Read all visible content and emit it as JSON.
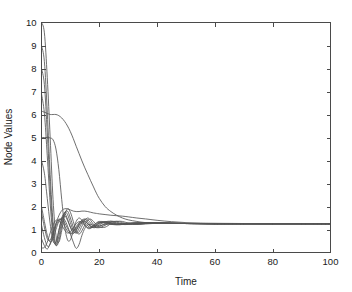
{
  "chart_data": {
    "type": "line",
    "title": "",
    "xlabel": "Time",
    "ylabel": "Node Values",
    "xlim": [
      0,
      100
    ],
    "ylim": [
      0,
      10
    ],
    "xticks": [
      0,
      20,
      40,
      60,
      80,
      100
    ],
    "yticks": [
      0,
      1,
      2,
      3,
      4,
      5,
      6,
      7,
      8,
      9,
      10
    ],
    "xtick_labels": [
      "0",
      "20",
      "40",
      "60",
      "80",
      "100"
    ],
    "ytick_labels": [
      "0",
      "1",
      "2",
      "3",
      "4",
      "5",
      "6",
      "7",
      "8",
      "9",
      "10"
    ],
    "grid": false,
    "legend": null,
    "box": true,
    "line_color": "#555555",
    "consensus_value": 1.25,
    "x": [
      0,
      1,
      2,
      3,
      4,
      5,
      6,
      7,
      8,
      9,
      10,
      11,
      12,
      13,
      14,
      15,
      16,
      17,
      18,
      19,
      20,
      22,
      24,
      26,
      28,
      30,
      33,
      36,
      40,
      45,
      50,
      55,
      60,
      70,
      80,
      90,
      100
    ],
    "series": [
      {
        "name": "node-1",
        "initial": 10,
        "values": [
          10.0,
          9.55,
          7.6,
          5.0,
          2.3,
          0.75,
          0.45,
          0.95,
          1.6,
          1.9,
          1.75,
          1.35,
          0.95,
          0.8,
          0.95,
          1.2,
          1.4,
          1.45,
          1.35,
          1.2,
          1.1,
          1.1,
          1.25,
          1.35,
          1.35,
          1.28,
          1.22,
          1.24,
          1.27,
          1.27,
          1.26,
          1.255,
          1.25,
          1.25,
          1.25,
          1.25,
          1.25
        ]
      },
      {
        "name": "node-2",
        "initial": 9.0,
        "values": [
          9.0,
          8.3,
          6.1,
          3.4,
          1.3,
          0.35,
          0.5,
          1.15,
          1.7,
          1.8,
          1.5,
          1.1,
          0.85,
          0.9,
          1.15,
          1.4,
          1.5,
          1.4,
          1.22,
          1.1,
          1.08,
          1.18,
          1.32,
          1.36,
          1.3,
          1.24,
          1.22,
          1.26,
          1.28,
          1.27,
          1.26,
          1.255,
          1.25,
          1.25,
          1.25,
          1.25,
          1.25
        ]
      },
      {
        "name": "node-3",
        "initial": 8.0,
        "values": [
          8.0,
          7.3,
          5.2,
          2.8,
          1.0,
          0.3,
          0.7,
          1.35,
          1.75,
          1.65,
          1.3,
          0.95,
          0.85,
          1.05,
          1.3,
          1.45,
          1.42,
          1.28,
          1.14,
          1.08,
          1.12,
          1.26,
          1.36,
          1.32,
          1.25,
          1.22,
          1.24,
          1.27,
          1.28,
          1.27,
          1.26,
          1.255,
          1.25,
          1.25,
          1.25,
          1.25,
          1.25
        ]
      },
      {
        "name": "node-4",
        "initial": 6.9,
        "values": [
          6.9,
          6.05,
          4.2,
          2.15,
          0.7,
          0.35,
          0.95,
          1.5,
          1.7,
          1.45,
          1.1,
          0.85,
          0.95,
          1.2,
          1.4,
          1.45,
          1.33,
          1.17,
          1.08,
          1.1,
          1.2,
          1.33,
          1.36,
          1.28,
          1.22,
          1.22,
          1.26,
          1.28,
          1.28,
          1.27,
          1.26,
          1.255,
          1.25,
          1.25,
          1.25,
          1.25,
          1.25
        ]
      },
      {
        "name": "node-5-plateau6",
        "initial": 6.15,
        "values": [
          6.15,
          6.1,
          6.05,
          6.0,
          6.0,
          6.0,
          5.95,
          5.85,
          5.7,
          5.5,
          5.25,
          4.95,
          4.62,
          4.3,
          3.98,
          3.68,
          3.4,
          3.12,
          2.85,
          2.58,
          2.35,
          2.0,
          1.78,
          1.62,
          1.5,
          1.42,
          1.35,
          1.3,
          1.28,
          1.27,
          1.26,
          1.255,
          1.25,
          1.25,
          1.25,
          1.25,
          1.25
        ]
      },
      {
        "name": "node-6-plateau5",
        "initial": 5.0,
        "values": [
          5.0,
          5.0,
          5.0,
          4.98,
          4.9,
          4.5,
          3.6,
          2.3,
          1.15,
          0.55,
          0.55,
          0.95,
          1.35,
          1.5,
          1.4,
          1.2,
          1.05,
          1.05,
          1.15,
          1.28,
          1.35,
          1.33,
          1.24,
          1.2,
          1.22,
          1.26,
          1.28,
          1.28,
          1.28,
          1.27,
          1.26,
          1.255,
          1.25,
          1.25,
          1.25,
          1.25,
          1.25
        ]
      },
      {
        "name": "node-7",
        "initial": 4.0,
        "values": [
          4.0,
          3.45,
          2.35,
          1.25,
          0.5,
          0.45,
          0.95,
          1.45,
          1.6,
          1.4,
          1.1,
          0.95,
          1.05,
          1.25,
          1.4,
          1.38,
          1.25,
          1.12,
          1.1,
          1.18,
          1.28,
          1.34,
          1.28,
          1.22,
          1.22,
          1.25,
          1.28,
          1.28,
          1.28,
          1.27,
          1.26,
          1.255,
          1.25,
          1.25,
          1.25,
          1.25,
          1.25
        ]
      },
      {
        "name": "node-8-rise",
        "initial": 1.75,
        "values": [
          1.75,
          1.1,
          0.6,
          0.55,
          0.85,
          1.25,
          1.6,
          1.82,
          1.9,
          1.9,
          1.85,
          1.8,
          1.78,
          1.78,
          1.8,
          1.8,
          1.78,
          1.75,
          1.72,
          1.7,
          1.68,
          1.65,
          1.62,
          1.6,
          1.58,
          1.55,
          1.5,
          1.46,
          1.4,
          1.34,
          1.3,
          1.28,
          1.27,
          1.26,
          1.25,
          1.25,
          1.25
        ]
      },
      {
        "name": "node-9",
        "initial": 1.2,
        "values": [
          1.2,
          0.65,
          0.28,
          0.35,
          0.75,
          1.15,
          1.4,
          1.45,
          1.3,
          1.05,
          0.85,
          0.82,
          0.98,
          1.18,
          1.32,
          1.34,
          1.25,
          1.14,
          1.1,
          1.16,
          1.26,
          1.33,
          1.3,
          1.24,
          1.22,
          1.25,
          1.28,
          1.28,
          1.28,
          1.27,
          1.26,
          1.255,
          1.25,
          1.25,
          1.25,
          1.25,
          1.25
        ]
      },
      {
        "name": "node-10",
        "initial": 0.6,
        "values": [
          0.6,
          0.3,
          0.15,
          0.4,
          0.85,
          1.25,
          1.45,
          1.38,
          1.15,
          0.92,
          0.82,
          0.92,
          1.12,
          1.3,
          1.36,
          1.28,
          1.15,
          1.08,
          1.12,
          1.22,
          1.3,
          1.3,
          1.24,
          1.22,
          1.24,
          1.27,
          1.28,
          1.28,
          1.28,
          1.27,
          1.26,
          1.255,
          1.25,
          1.25,
          1.25,
          1.25,
          1.25
        ]
      },
      {
        "name": "node-11-dip",
        "initial": 2.0,
        "values": [
          2.0,
          1.35,
          0.75,
          0.45,
          0.6,
          1.0,
          1.35,
          1.5,
          1.42,
          1.15,
          0.8,
          0.45,
          0.18,
          0.35,
          0.75,
          1.05,
          1.2,
          1.22,
          1.18,
          1.15,
          1.16,
          1.22,
          1.25,
          1.25,
          1.25,
          1.26,
          1.27,
          1.27,
          1.27,
          1.27,
          1.26,
          1.255,
          1.25,
          1.25,
          1.25,
          1.25,
          1.25
        ]
      },
      {
        "name": "node-12",
        "initial": 0.2,
        "values": [
          0.2,
          0.22,
          0.45,
          0.85,
          1.2,
          1.4,
          1.38,
          1.2,
          0.98,
          0.85,
          0.9,
          1.08,
          1.25,
          1.34,
          1.3,
          1.18,
          1.08,
          1.08,
          1.18,
          1.28,
          1.32,
          1.28,
          1.22,
          1.22,
          1.25,
          1.28,
          1.28,
          1.28,
          1.28,
          1.27,
          1.26,
          1.255,
          1.25,
          1.25,
          1.25,
          1.25,
          1.25
        ]
      }
    ]
  },
  "axes": {
    "x_title": "Time",
    "y_title": "Node Values"
  }
}
